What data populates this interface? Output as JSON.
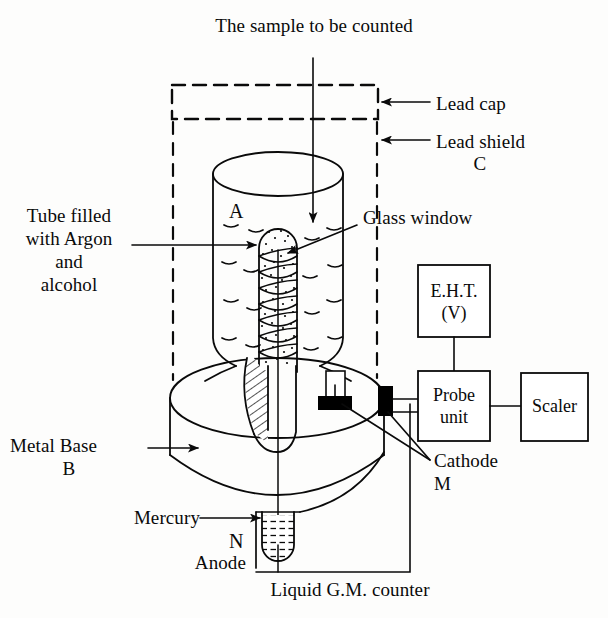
{
  "figure": {
    "title": "Liquid G.M. counter",
    "caption": "Liquid G.M. counter"
  },
  "labels": {
    "sample": "The sample to be counted",
    "lead_cap": "Lead cap",
    "lead_shield_line1": "Lead shield",
    "lead_shield_line2": "C",
    "glass_window": "Glass window",
    "tube_filled_line1": "Tube filled",
    "tube_filled_line2": "with Argon",
    "tube_filled_line3": "and",
    "tube_filled_line4": "alcohol",
    "marker_a": "A",
    "metal_base_line1": "Metal Base",
    "metal_base_line2": "B",
    "mercury": "Mercury",
    "marker_n": "N",
    "anode": "Anode",
    "cathode_line1": "Cathode",
    "cathode_line2": "M",
    "caption": "Liquid G.M. counter"
  },
  "boxes": {
    "eht_line1": "E.H.T.",
    "eht_line2": "(V)",
    "probe_line1": "Probe",
    "probe_line2": "unit",
    "scaler": "Scaler"
  },
  "colors": {
    "ink": "#0a0a0a",
    "paper": "#fdfdfc",
    "terminal_fill": "#000000"
  }
}
